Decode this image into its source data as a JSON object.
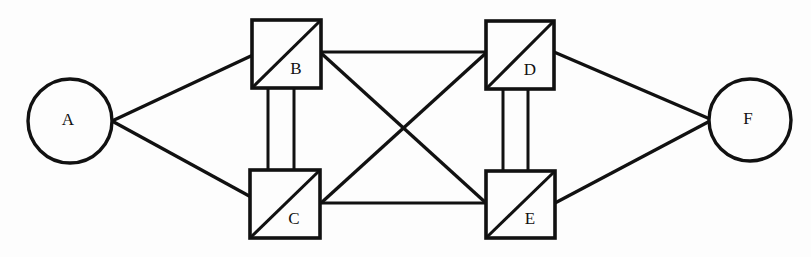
{
  "diagram": {
    "canvas": {
      "width": 811,
      "height": 257
    },
    "colors": {
      "background": "#fdfdfd",
      "stroke": "#111111",
      "node_fill": "#fdfdfd"
    },
    "nodes": [
      {
        "id": "A",
        "label": "A",
        "shape": "circle",
        "cx": 70,
        "cy": 121,
        "r": 42,
        "stroke_width": 3.4,
        "label_x": 68,
        "label_y": 121,
        "has_diagonal": false
      },
      {
        "id": "B",
        "label": "B",
        "shape": "square",
        "x": 252,
        "y": 20,
        "width": 69,
        "height": 68,
        "stroke_width": 3.6,
        "label_x": 296,
        "label_y": 70,
        "has_diagonal": true,
        "diagonal_direction": "bottom-left-to-top-right"
      },
      {
        "id": "C",
        "label": "C",
        "shape": "square",
        "x": 250,
        "y": 170,
        "width": 70,
        "height": 68,
        "stroke_width": 3.6,
        "label_x": 294,
        "label_y": 220,
        "has_diagonal": true,
        "diagonal_direction": "bottom-left-to-top-right"
      },
      {
        "id": "D",
        "label": "D",
        "shape": "square",
        "x": 486,
        "y": 21,
        "width": 68,
        "height": 68,
        "stroke_width": 3.6,
        "label_x": 530,
        "label_y": 71,
        "has_diagonal": true,
        "diagonal_direction": "bottom-left-to-top-right"
      },
      {
        "id": "E",
        "label": "E",
        "shape": "square",
        "x": 486,
        "y": 171,
        "width": 69,
        "height": 67,
        "stroke_width": 3.6,
        "label_x": 530,
        "label_y": 220,
        "has_diagonal": true,
        "diagonal_direction": "bottom-left-to-top-right"
      },
      {
        "id": "F",
        "label": "F",
        "shape": "circle",
        "cx": 750,
        "cy": 120,
        "r": 41,
        "stroke_width": 3.4,
        "label_x": 748,
        "label_y": 120,
        "has_diagonal": false
      }
    ],
    "edges": [
      {
        "id": "A-B",
        "from": "A",
        "to": "B",
        "x1": 112,
        "y1": 121,
        "x2": 253,
        "y2": 55,
        "stroke_width": 3.3,
        "kind": "diagonal"
      },
      {
        "id": "A-C",
        "from": "A",
        "to": "C",
        "x1": 112,
        "y1": 121,
        "x2": 251,
        "y2": 197,
        "stroke_width": 3.3,
        "kind": "diagonal"
      },
      {
        "id": "B-C-left",
        "from": "B",
        "to": "C",
        "x1": 268,
        "y1": 88,
        "x2": 268,
        "y2": 171,
        "stroke_width": 3.0,
        "kind": "vertical"
      },
      {
        "id": "B-C-right",
        "from": "B",
        "to": "C",
        "x1": 294,
        "y1": 88,
        "x2": 294,
        "y2": 171,
        "stroke_width": 3.0,
        "kind": "vertical"
      },
      {
        "id": "B-D",
        "from": "B",
        "to": "D",
        "x1": 321,
        "y1": 52,
        "x2": 486,
        "y2": 52,
        "stroke_width": 3.2,
        "kind": "horizontal"
      },
      {
        "id": "B-E",
        "from": "B",
        "to": "E",
        "x1": 321,
        "y1": 53,
        "x2": 486,
        "y2": 203,
        "stroke_width": 3.3,
        "kind": "diagonal"
      },
      {
        "id": "D-C",
        "from": "D",
        "to": "C",
        "x1": 486,
        "y1": 53,
        "x2": 321,
        "y2": 203,
        "stroke_width": 3.3,
        "kind": "diagonal"
      },
      {
        "id": "C-E",
        "from": "C",
        "to": "E",
        "x1": 321,
        "y1": 203,
        "x2": 486,
        "y2": 203,
        "stroke_width": 3.2,
        "kind": "horizontal"
      },
      {
        "id": "D-E-left",
        "from": "D",
        "to": "E",
        "x1": 503,
        "y1": 89,
        "x2": 503,
        "y2": 171,
        "stroke_width": 3.0,
        "kind": "vertical"
      },
      {
        "id": "D-E-right",
        "from": "D",
        "to": "E",
        "x1": 528,
        "y1": 89,
        "x2": 528,
        "y2": 171,
        "stroke_width": 3.0,
        "kind": "vertical"
      },
      {
        "id": "D-F",
        "from": "D",
        "to": "F",
        "x1": 554,
        "y1": 52,
        "x2": 710,
        "y2": 119,
        "stroke_width": 3.3,
        "kind": "diagonal"
      },
      {
        "id": "E-F",
        "from": "E",
        "to": "F",
        "x1": 555,
        "y1": 203,
        "x2": 710,
        "y2": 121,
        "stroke_width": 3.3,
        "kind": "diagonal"
      }
    ]
  }
}
